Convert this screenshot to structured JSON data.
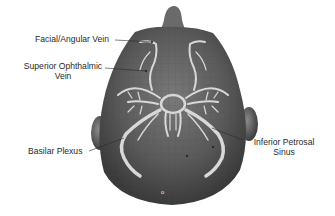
{
  "figure": {
    "colors": {
      "skin": "#5a5a5a",
      "skin_highlight": "#8a8a8a",
      "veins": "#d8d8d8",
      "label_text": "#2a2a2a",
      "background": "#ffffff"
    },
    "labels": [
      {
        "id": "facial_angular",
        "text": "Facial/Angular Vein"
      },
      {
        "id": "superior_ophthalmic_1",
        "text": "Superior Ophthalmic"
      },
      {
        "id": "superior_ophthalmic_2",
        "text": "Vein"
      },
      {
        "id": "basilar_plexus",
        "text": "Basilar Plexus"
      },
      {
        "id": "inferior_petrosal_1",
        "text": "Inferior Petrosal"
      },
      {
        "id": "inferior_petrosal_2",
        "text": "Sinus"
      }
    ],
    "marker": "o"
  }
}
